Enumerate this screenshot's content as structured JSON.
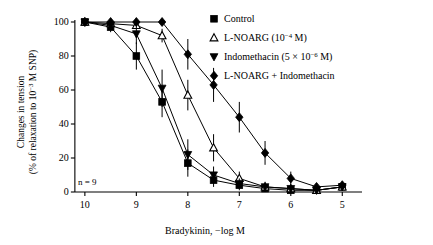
{
  "chart_data": {
    "type": "line",
    "title": "",
    "xlabel": "Bradykinin, −log M",
    "ylabel_line1": "Changes in tension",
    "ylabel_line2": "(% of relaxation to 10−3 M SNP)",
    "ylabel_full": "Changes in tension (% of relaxation to 10−3 M SNP)",
    "annotation": "n = 9",
    "grid": false,
    "legend_position": "top-right",
    "xlim": [
      10.25,
      4.85
    ],
    "ylim": [
      -3,
      105
    ],
    "x_ticks": [
      10,
      9,
      8,
      7,
      6,
      5
    ],
    "x_tick_labels": [
      "10",
      "9",
      "8",
      "7",
      "6",
      "5"
    ],
    "y_ticks": [
      0,
      20,
      40,
      60,
      80,
      100
    ],
    "y_tick_labels": [
      "0",
      "20",
      "40",
      "60",
      "80",
      "100"
    ],
    "x": [
      10,
      9.5,
      9,
      8.5,
      8,
      7.5,
      7,
      6.5,
      6,
      5.5,
      5
    ],
    "series": [
      {
        "name": "Control",
        "marker": "filled-square",
        "values": [
          100,
          97,
          80,
          53,
          17,
          7,
          4,
          2,
          1,
          1,
          3
        ],
        "errors": [
          1.5,
          3,
          8,
          9,
          8,
          4,
          3,
          2,
          2,
          2,
          2
        ]
      },
      {
        "name": "L-NOARG (10−4 M)",
        "marker": "open-triangle-up",
        "values": [
          100,
          99,
          98,
          92,
          57,
          26,
          8,
          3,
          2,
          1,
          3
        ],
        "errors": [
          1.5,
          2,
          2,
          4,
          9,
          8,
          4,
          3,
          2,
          2,
          2
        ]
      },
      {
        "name": "Indomethacin (5 × 10−6 M)",
        "marker": "filled-triangle-down",
        "values": [
          100,
          98,
          93,
          61,
          22,
          10,
          5,
          3,
          2,
          1,
          3
        ],
        "errors": [
          1.5,
          3,
          6,
          11,
          9,
          5,
          3,
          2,
          2,
          2,
          2
        ]
      },
      {
        "name": "L-NOARG + Indomethacin",
        "marker": "filled-diamond",
        "values": [
          100,
          100,
          100,
          100,
          81,
          63,
          44,
          23,
          8,
          3,
          4
        ],
        "errors": [
          1.5,
          2,
          2,
          2,
          9,
          10,
          9,
          7,
          4,
          2,
          2
        ]
      }
    ]
  },
  "legend": {
    "items": [
      {
        "label": "Control",
        "marker": "filled-square"
      },
      {
        "label_main": "L-NOARG (10",
        "label_sup": "−4",
        "label_tail": " M)",
        "marker": "open-triangle-up"
      },
      {
        "label_main": "Indomethacin (5 × 10",
        "label_sup": "−6",
        "label_tail": " M)",
        "marker": "filled-triangle-down"
      },
      {
        "label": "L-NOARG + Indomethacin",
        "marker": "filled-diamond"
      }
    ]
  },
  "axes": {
    "x_title_main": "Bradykinin, −log M",
    "y_title_line1": "Changes in tension",
    "y_title_line2_a": "(% of relaxation to 10",
    "y_title_line2_sup": "−3",
    "y_title_line2_b": " M SNP)"
  }
}
